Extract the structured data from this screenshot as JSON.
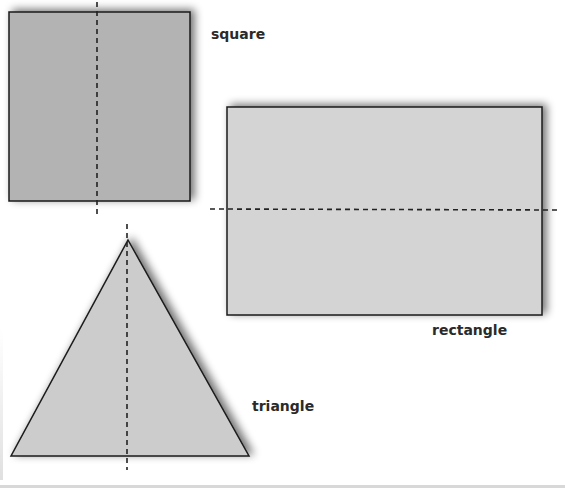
{
  "figure": {
    "shapes": [
      {
        "id": "square",
        "label": "square",
        "fill": "#b3b3b3",
        "axis": "vertical"
      },
      {
        "id": "rectangle",
        "label": "rectangle",
        "fill": "#d4d4d4",
        "axis": "horizontal"
      },
      {
        "id": "triangle",
        "label": "triangle",
        "fill": "#cccccc",
        "axis": "vertical"
      }
    ],
    "colors": {
      "outline": "#1a1a1a",
      "shadow": "#888888",
      "dash": "#222222",
      "background": "#ffffff"
    }
  }
}
